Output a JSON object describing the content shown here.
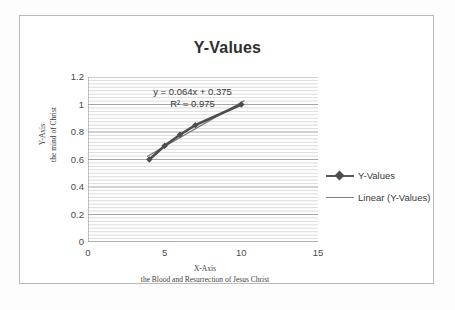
{
  "chart_data": {
    "type": "scatter",
    "title": "Y-Values",
    "xlabel": "X-Axis",
    "xlabel_sub": "the Blood and Resurrection of Jesus Christ",
    "ylabel": "Y-Axis",
    "ylabel_sub": "the mind of Christ",
    "xlim": [
      0,
      15
    ],
    "ylim": [
      0,
      1.2
    ],
    "x_ticks": [
      "0",
      "5",
      "10",
      "15"
    ],
    "x_tick_values": [
      0,
      5,
      10,
      15
    ],
    "y_ticks": [
      "0",
      "0.2",
      "0.4",
      "0.6",
      "0.8",
      "1",
      "1.2"
    ],
    "y_tick_values": [
      0,
      0.2,
      0.4,
      0.6,
      0.8,
      1,
      1.2
    ],
    "grid": "horizontal-minor",
    "minor_grid_step": 0.025,
    "legend_position": "right",
    "series": [
      {
        "name": "Y-Values",
        "marker": "diamond",
        "color": "#4d4d4d",
        "x": [
          4,
          5,
          6,
          7,
          10
        ],
        "values": [
          0.6,
          0.7,
          0.78,
          0.85,
          1.0
        ]
      },
      {
        "name": "Linear (Y-Values)",
        "marker": "none",
        "color": "#7d7d7d",
        "type": "trendline"
      }
    ],
    "annotations": {
      "equation": "y = 0.064x + 0.375",
      "r_squared": "R² = 0.975"
    }
  },
  "legend": {
    "items": [
      {
        "label": "Y-Values"
      },
      {
        "label": "Linear (Y-Values)"
      }
    ]
  }
}
